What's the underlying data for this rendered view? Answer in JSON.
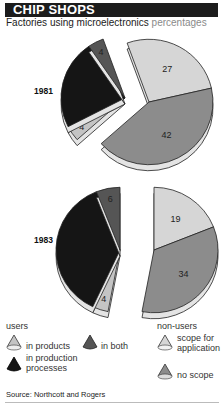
{
  "header": {
    "title": "CHIP SHOPS",
    "subtitle": "Factories using microelectronics",
    "unit": "percentages"
  },
  "colors": {
    "in_products": "#c4c4c4",
    "in_both": "#555555",
    "in_production_processes": "#151515",
    "scope_for_application": "#d6d6d6",
    "no_scope": "#8c8c8c",
    "title_bg": "#1c1c1c"
  },
  "legend": {
    "users_heading": "users",
    "nonusers_heading": "non-users",
    "in_products": "in products",
    "in_both": "in both",
    "in_production_processes": "in production processes",
    "scope_for_application": "scope for application",
    "no_scope": "no scope"
  },
  "source": "Source: Northcott and Rogers",
  "chart_data": [
    {
      "type": "pie",
      "title": "1981",
      "categories": [
        "in products",
        "in both",
        "in production processes",
        "scope for application",
        "no scope"
      ],
      "groups": [
        "users",
        "users",
        "users",
        "non-users",
        "non-users"
      ],
      "values": [
        4,
        4,
        23,
        27,
        42
      ],
      "labels_shown": [
        "4",
        "4",
        "",
        "27",
        "42"
      ]
    },
    {
      "type": "pie",
      "title": "1983",
      "categories": [
        "in products",
        "in both",
        "in production processes",
        "scope for application",
        "no scope"
      ],
      "groups": [
        "users",
        "users",
        "users",
        "non-users",
        "non-users"
      ],
      "values": [
        4,
        6,
        37,
        19,
        34
      ],
      "labels_shown": [
        "4",
        "6",
        "",
        "19",
        "34"
      ]
    }
  ]
}
